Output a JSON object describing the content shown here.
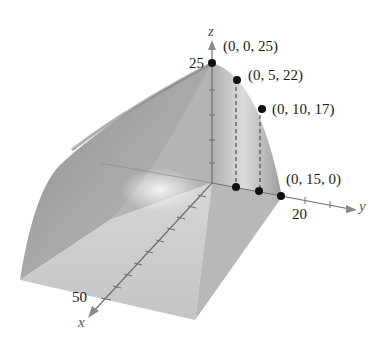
{
  "figure": {
    "type": "3d-surface-plot"
  },
  "axes": {
    "x": {
      "label": "x",
      "tick_label": "50"
    },
    "y": {
      "label": "y",
      "tick_label": "20"
    },
    "z": {
      "label": "z",
      "tick_label": "25"
    }
  },
  "points": [
    {
      "label": "(0, 0, 25)",
      "x": 0,
      "y": 0,
      "z": 25
    },
    {
      "label": "(0, 5, 22)",
      "x": 0,
      "y": 5,
      "z": 22
    },
    {
      "label": "(0, 10, 17)",
      "x": 0,
      "y": 10,
      "z": 17
    },
    {
      "label": "(0, 15, 0)",
      "x": 0,
      "y": 15,
      "z": 0
    }
  ],
  "colors": {
    "surface_light": "#c8c8c8",
    "surface_mid": "#a9a9a9",
    "surface_dark": "#8c8c8c",
    "axis": "#6e6e6e",
    "point": "#111111"
  }
}
